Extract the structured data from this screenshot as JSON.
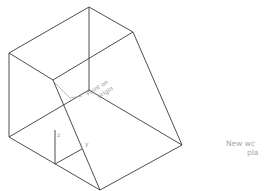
{
  "diagram": {
    "type": "isometric-wireframe",
    "annotation": {
      "line1": "Point on",
      "line2": "origin"
    },
    "axes": {
      "z_label": "z",
      "y_label": "y"
    },
    "side_note": {
      "line1": "New wc",
      "line2": "pla"
    },
    "colors": {
      "edge": "#3a3a3a",
      "text": "#9a9a9a"
    }
  }
}
